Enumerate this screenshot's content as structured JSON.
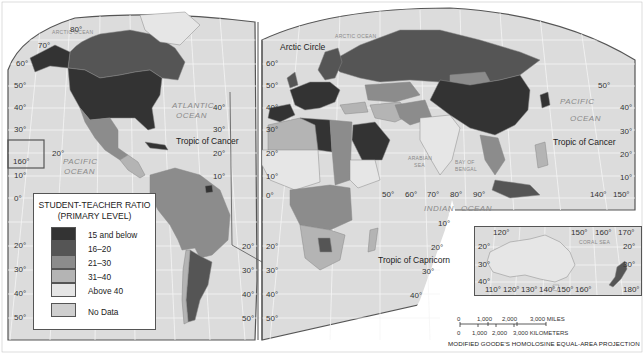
{
  "map": {
    "title": "STUDENT-TEACHER RATIO (PRIMARY LEVEL)",
    "projection": "MODIFIED GOODE'S HOMOLOSINE EQUAL-AREA PROJECTION",
    "colors": {
      "ocean": "#dcdcdc",
      "graticule": "#f4f4f4",
      "border": "#9a9a9a",
      "frame": "#555555",
      "background": "#ffffff"
    }
  },
  "legend": {
    "title_line1": "STUDENT-TEACHER RATIO",
    "title_line2": "(PRIMARY LEVEL)",
    "items": [
      {
        "label": "15  and below",
        "color": "#333333"
      },
      {
        "label": "16–20",
        "color": "#555555"
      },
      {
        "label": "21–30",
        "color": "#8c8c8c"
      },
      {
        "label": "31–40",
        "color": "#b4b4b4"
      },
      {
        "label": "Above 40",
        "color": "#e6e6e6"
      }
    ],
    "no_data": {
      "label": "No Data",
      "color": "#cfcfcf"
    }
  },
  "labels": {
    "oceans": {
      "arctic_left": "ARCTIC OCEAN",
      "arctic_right": "ARCTIC OCEAN",
      "atlantic_1": "ATLANTIC",
      "atlantic_2": "OCEAN",
      "pacific_left_1": "PACIFIC",
      "pacific_left_2": "OCEAN",
      "pacific_right_1": "PACIFIC",
      "pacific_right_2": "OCEAN",
      "indian_1": "INDIAN",
      "indian_2": "OCEAN",
      "arabian_sea_1": "ARABIAN",
      "arabian_sea_2": "SEA",
      "bay_of_bengal_1": "BAY OF",
      "bay_of_bengal_2": "BENGAL",
      "coral_sea": "CORAL   SEA"
    },
    "lines": {
      "arctic_circle": "Arctic Circle",
      "tropic_cancer_west": "Tropic of Cancer",
      "tropic_cancer_east": "Tropic of Cancer",
      "tropic_capricorn": "Tropic of Capricorn"
    },
    "latitudes_left": [
      "80°",
      "70°",
      "60°",
      "50°",
      "40°",
      "30°",
      "20°",
      "10°",
      "0°",
      "10°",
      "20°",
      "30°",
      "40°",
      "50°"
    ],
    "latitudes_mid_left": [
      "40°",
      "30°",
      "20°",
      "10°",
      "20°",
      "30°",
      "40°",
      "50°"
    ],
    "latitudes_mid_right": [
      "60°",
      "50°",
      "40°",
      "30°",
      "20°",
      "10°",
      "0°",
      "10°",
      "20°",
      "30°",
      "40°",
      "50°"
    ],
    "latitudes_right": [
      "50°",
      "40°",
      "30°",
      "20°",
      "10°"
    ],
    "longitudes_indian": [
      "50°",
      "60°",
      "70°",
      "80°",
      "90°"
    ],
    "longitudes_pacific": [
      "140°",
      "150°"
    ],
    "misc_degrees": {
      "hawaii_lon": "160°",
      "hawaii_lat": "20°",
      "prime_meridian": "0°",
      "indian_10": "10°",
      "indian_20": "20°",
      "indian_30": "30°",
      "indian_40": "40°"
    }
  },
  "inset": {
    "top_lons": [
      "120°",
      "150°",
      "160°",
      "170°"
    ],
    "bottom_lons": [
      "110°",
      "120°",
      "130°",
      "140°",
      "150°",
      "160°",
      "180°"
    ],
    "left_lats": [
      "20°",
      "30°",
      "40°"
    ],
    "right_lats": [
      "20°",
      "30°"
    ]
  },
  "scale": {
    "miles": [
      "0",
      "1,000",
      "2,000",
      "3,000 MILES"
    ],
    "kilometers": [
      "0",
      "1,000",
      "2,000",
      "3,000 KILOMETERS"
    ]
  }
}
